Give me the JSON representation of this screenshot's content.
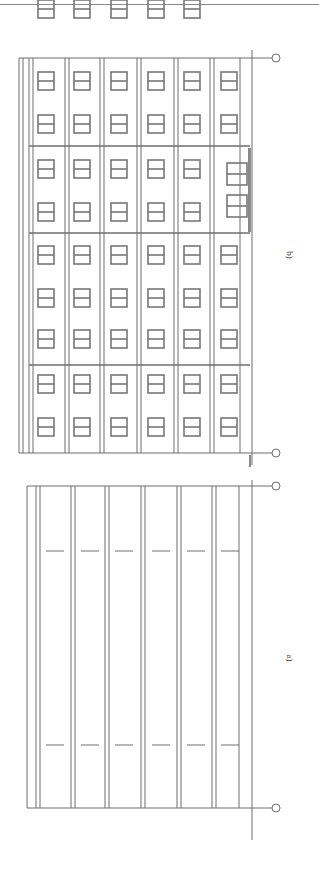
{
  "figure": {
    "panels": [
      {
        "id": "b",
        "label": "b)",
        "description": "facade elevation with 6 window columns and 10 window rows, entrance doors"
      },
      {
        "id": "a",
        "label": "a)",
        "description": "plan/section with 6 bays and dashed markers"
      }
    ],
    "colors": {
      "line": "#6e6e6e",
      "window": "#7a7a7a",
      "background": "#ffffff"
    },
    "orientation": "rotated 90 degrees"
  }
}
